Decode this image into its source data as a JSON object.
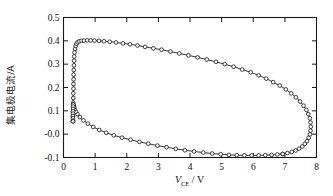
{
  "figure": {
    "kind": "scientific-plot",
    "background": "#ffffff",
    "frame_color": "#1a1a1a",
    "marker": "open-circle",
    "line_color": "#111111"
  },
  "axes": {
    "x": {
      "label_main": "V",
      "label_sub": "CE",
      "label_unit": "/ V",
      "label_full": "V_CE / V",
      "min": 0,
      "max": 8,
      "ticks": [
        0,
        1,
        2,
        3,
        4,
        5,
        6,
        7,
        8
      ],
      "tick_labels": [
        "0",
        "1",
        "2",
        "3",
        "4",
        "5",
        "6",
        "7",
        "8"
      ]
    },
    "y": {
      "label_full": "集电极电流/A",
      "min": -0.1,
      "max": 0.5,
      "ticks": [
        -0.1,
        0.0,
        0.1,
        0.2,
        0.3,
        0.4,
        0.5
      ],
      "tick_labels": [
        "-0.1",
        "-0.0",
        "0.1",
        "0.2",
        "0.3",
        "0.4",
        "0.5"
      ]
    }
  },
  "chart_data": {
    "type": "line",
    "title": "",
    "xlabel": "V_CE / V",
    "ylabel": "集电极电流/A",
    "xlim": [
      0,
      8
    ],
    "ylim": [
      -0.1,
      0.5
    ],
    "grid": false,
    "legend": null,
    "marker": "o",
    "series": [
      {
        "name": "upper-branch",
        "points": [
          [
            0.3,
            0.055
          ],
          [
            0.3,
            0.075
          ],
          [
            0.3,
            0.095
          ],
          [
            0.305,
            0.115
          ],
          [
            0.305,
            0.135
          ],
          [
            0.31,
            0.155
          ],
          [
            0.31,
            0.175
          ],
          [
            0.315,
            0.195
          ],
          [
            0.315,
            0.215
          ],
          [
            0.32,
            0.235
          ],
          [
            0.32,
            0.255
          ],
          [
            0.325,
            0.275
          ],
          [
            0.33,
            0.295
          ],
          [
            0.335,
            0.315
          ],
          [
            0.34,
            0.333
          ],
          [
            0.35,
            0.35
          ],
          [
            0.365,
            0.365
          ],
          [
            0.385,
            0.378
          ],
          [
            0.41,
            0.388
          ],
          [
            0.45,
            0.394
          ],
          [
            0.5,
            0.398
          ],
          [
            0.57,
            0.4
          ],
          [
            0.65,
            0.401
          ],
          [
            0.75,
            0.402
          ],
          [
            0.86,
            0.402
          ],
          [
            0.98,
            0.401
          ],
          [
            1.12,
            0.4
          ],
          [
            1.28,
            0.398
          ],
          [
            1.46,
            0.396
          ],
          [
            1.66,
            0.393
          ],
          [
            1.88,
            0.389
          ],
          [
            2.1,
            0.385
          ],
          [
            2.34,
            0.38
          ],
          [
            2.58,
            0.374
          ],
          [
            2.84,
            0.368
          ],
          [
            3.1,
            0.362
          ],
          [
            3.38,
            0.354
          ],
          [
            3.66,
            0.346
          ],
          [
            3.95,
            0.338
          ],
          [
            4.24,
            0.329
          ],
          [
            4.53,
            0.32
          ],
          [
            4.82,
            0.31
          ],
          [
            5.1,
            0.3
          ],
          [
            5.38,
            0.289
          ],
          [
            5.65,
            0.277
          ],
          [
            5.92,
            0.265
          ],
          [
            6.17,
            0.252
          ],
          [
            6.41,
            0.238
          ],
          [
            6.63,
            0.223
          ],
          [
            6.84,
            0.208
          ],
          [
            7.03,
            0.192
          ],
          [
            7.2,
            0.175
          ],
          [
            7.35,
            0.158
          ],
          [
            7.48,
            0.14
          ],
          [
            7.59,
            0.122
          ],
          [
            7.68,
            0.104
          ],
          [
            7.74,
            0.086
          ],
          [
            7.79,
            0.068
          ],
          [
            7.81,
            0.05
          ],
          [
            7.82,
            0.032
          ],
          [
            7.81,
            0.015
          ],
          [
            7.79,
            -0.001
          ],
          [
            7.75,
            -0.016
          ],
          [
            7.7,
            -0.03
          ],
          [
            7.63,
            -0.042
          ],
          [
            7.55,
            -0.053
          ],
          [
            7.45,
            -0.062
          ],
          [
            7.34,
            -0.07
          ],
          [
            7.22,
            -0.076
          ],
          [
            7.08,
            -0.081
          ],
          [
            6.93,
            -0.085
          ]
        ]
      },
      {
        "name": "lower-branch",
        "points": [
          [
            6.93,
            -0.085
          ],
          [
            6.76,
            -0.087
          ],
          [
            6.58,
            -0.089
          ],
          [
            6.38,
            -0.09
          ],
          [
            6.17,
            -0.091
          ],
          [
            5.95,
            -0.091
          ],
          [
            5.72,
            -0.091
          ],
          [
            5.48,
            -0.09
          ],
          [
            5.23,
            -0.089
          ],
          [
            4.97,
            -0.086
          ],
          [
            4.7,
            -0.083
          ],
          [
            4.42,
            -0.079
          ],
          [
            4.13,
            -0.074
          ],
          [
            3.84,
            -0.069
          ],
          [
            3.55,
            -0.063
          ],
          [
            3.26,
            -0.056
          ],
          [
            2.97,
            -0.049
          ],
          [
            2.68,
            -0.041
          ],
          [
            2.4,
            -0.033
          ],
          [
            2.12,
            -0.024
          ],
          [
            1.85,
            -0.015
          ],
          [
            1.59,
            -0.005
          ],
          [
            1.35,
            0.006
          ],
          [
            1.13,
            0.018
          ],
          [
            0.94,
            0.031
          ],
          [
            0.77,
            0.045
          ],
          [
            0.63,
            0.059
          ],
          [
            0.52,
            0.073
          ],
          [
            0.44,
            0.086
          ],
          [
            0.39,
            0.097
          ],
          [
            0.355,
            0.107
          ],
          [
            0.335,
            0.115
          ],
          [
            0.32,
            0.121
          ],
          [
            0.312,
            0.125
          ],
          [
            0.308,
            0.127
          ]
        ]
      },
      {
        "name": "closing-segment",
        "points": [
          [
            0.308,
            0.127
          ],
          [
            0.305,
            0.118
          ],
          [
            0.303,
            0.108
          ],
          [
            0.301,
            0.098
          ],
          [
            0.3,
            0.088
          ],
          [
            0.3,
            0.078
          ],
          [
            0.3,
            0.068
          ],
          [
            0.3,
            0.058
          ],
          [
            0.3,
            0.055
          ]
        ]
      }
    ]
  }
}
